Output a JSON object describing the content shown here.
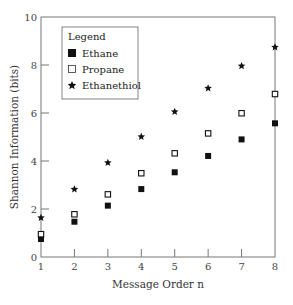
{
  "chart_data": {
    "type": "scatter",
    "title": "",
    "xlabel": "Message Order n",
    "ylabel": "Shannon Information (bits)",
    "xlim": [
      1,
      8
    ],
    "ylim": [
      0,
      10
    ],
    "x_ticks": [
      1,
      2,
      3,
      4,
      5,
      6,
      7,
      8
    ],
    "y_ticks": [
      0,
      2,
      4,
      6,
      8,
      10
    ],
    "grid": false,
    "legend_title": "Legend",
    "legend_position": "upper-left",
    "x": [
      1,
      2,
      3,
      4,
      5,
      6,
      7,
      8
    ],
    "series": [
      {
        "name": "Ethane",
        "marker": "filled-square",
        "color": "#111111",
        "values": [
          0.75,
          1.47,
          2.14,
          2.83,
          3.53,
          4.21,
          4.9,
          5.57
        ]
      },
      {
        "name": "Propane",
        "marker": "open-square",
        "color": "#111111",
        "values": [
          0.95,
          1.78,
          2.61,
          3.49,
          4.32,
          5.15,
          5.99,
          6.79
        ]
      },
      {
        "name": "Ethanethiol",
        "marker": "star",
        "color": "#111111",
        "values": [
          1.64,
          2.82,
          3.93,
          5.01,
          6.05,
          7.03,
          7.96,
          8.74
        ]
      }
    ]
  },
  "legend": {
    "title": "Legend",
    "items": [
      "Ethane",
      "Propane",
      "Ethanethiol"
    ]
  },
  "axes": {
    "xlabel": "Message Order n",
    "ylabel": "Shannon Information (bits)"
  }
}
